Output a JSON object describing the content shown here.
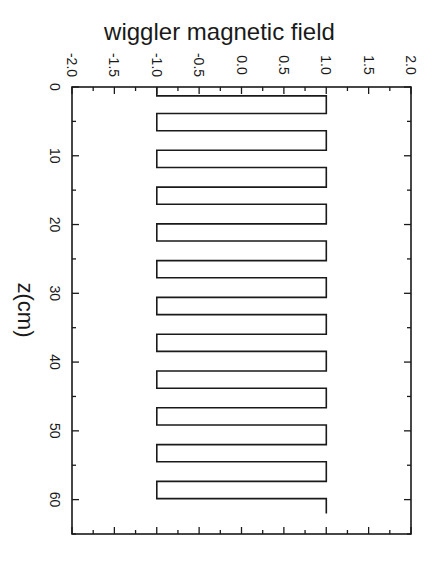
{
  "chart_data": {
    "type": "line",
    "title": "wiggler magnetic field",
    "xlabel": "z(cm)",
    "ylabel": "",
    "orientation": "rotated-90-clockwise",
    "field_axis": {
      "label": "wiggler magnetic field",
      "range": [
        -2.0,
        2.0
      ],
      "ticks": [
        "-2.0",
        "-1.5",
        "-1.0",
        "-0.5",
        "0.0",
        "0.5",
        "1.0",
        "1.5",
        "2.0"
      ],
      "tick_values": [
        -2.0,
        -1.5,
        -1.0,
        -0.5,
        0.0,
        0.5,
        1.0,
        1.5,
        2.0
      ]
    },
    "z_axis": {
      "label": "z(cm)",
      "range": [
        0,
        65
      ],
      "ticks": [
        "0",
        "10",
        "20",
        "30",
        "40",
        "50",
        "60"
      ],
      "tick_values": [
        0,
        10,
        20,
        30,
        40,
        50,
        60
      ]
    },
    "grid": false,
    "legend": null,
    "series": [
      {
        "name": "B (square wave)",
        "description": "Square wave alternating between -1.0 and +1.0, period ~5.35 cm, starting at -1.0 at z=0 and ending at +1.0 at z~62",
        "z": [
          0,
          1.3,
          1.3,
          3.85,
          3.85,
          6.35,
          6.35,
          9.2,
          9.2,
          11.7,
          11.7,
          14.55,
          14.55,
          17.05,
          17.05,
          19.9,
          19.9,
          22.4,
          22.4,
          25.25,
          25.25,
          27.75,
          27.75,
          30.6,
          30.6,
          33.1,
          33.1,
          35.95,
          35.95,
          38.45,
          38.45,
          41.3,
          41.3,
          43.8,
          43.8,
          46.65,
          46.65,
          49.15,
          49.15,
          52.0,
          52.0,
          54.5,
          54.5,
          57.35,
          57.35,
          59.85,
          59.85,
          62.0
        ],
        "B": [
          -1,
          -1,
          1,
          1,
          -1,
          -1,
          1,
          1,
          -1,
          -1,
          1,
          1,
          -1,
          -1,
          1,
          1,
          -1,
          -1,
          1,
          1,
          -1,
          -1,
          1,
          1,
          -1,
          -1,
          1,
          1,
          -1,
          -1,
          1,
          1,
          -1,
          -1,
          1,
          1,
          -1,
          -1,
          1,
          1,
          -1,
          -1,
          1,
          1,
          -1,
          -1,
          1,
          1
        ]
      }
    ]
  }
}
